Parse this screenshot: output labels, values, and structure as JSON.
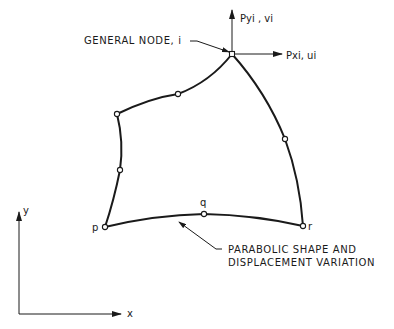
{
  "diagram": {
    "labels": {
      "general_node": "GENERAL NODE, i",
      "force_y": "Pyi , vi",
      "force_x": "Pxi, ui",
      "node_p": "p",
      "node_q": "q",
      "node_r": "r",
      "annotation_line1": "PARABOLIC SHAPE AND",
      "annotation_line2": "DISPLACEMENT VARIATION",
      "axis_x": "x",
      "axis_y": "y"
    },
    "nodes": [
      {
        "id": "i",
        "x": 232,
        "y": 54
      },
      {
        "id": "top-mid",
        "x": 178,
        "y": 94
      },
      {
        "id": "top-left-corner",
        "x": 117,
        "y": 114
      },
      {
        "id": "left-mid",
        "x": 120,
        "y": 170
      },
      {
        "id": "p",
        "x": 105,
        "y": 227
      },
      {
        "id": "q",
        "x": 204,
        "y": 214
      },
      {
        "id": "r",
        "x": 303,
        "y": 226
      },
      {
        "id": "right-mid",
        "x": 285,
        "y": 139
      }
    ],
    "colors": {
      "line": "#1a1a1a",
      "background": "#ffffff"
    }
  }
}
